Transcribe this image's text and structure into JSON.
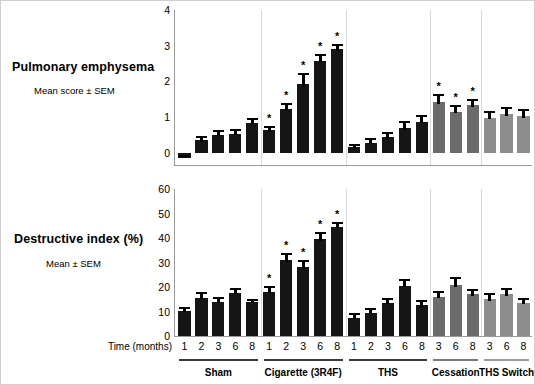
{
  "figure": {
    "xaxis_caption": "Time (months)",
    "groups": [
      {
        "name": "Sham",
        "times": [
          "1",
          "2",
          "3",
          "6",
          "8"
        ],
        "shade": "dark"
      },
      {
        "name": "Cigarette (3R4F)",
        "times": [
          "1",
          "2",
          "3",
          "6",
          "8"
        ],
        "shade": "dark"
      },
      {
        "name": "THS",
        "times": [
          "1",
          "2",
          "3",
          "6",
          "8"
        ],
        "shade": "dark"
      },
      {
        "name": "Cessation",
        "times": [
          "3",
          "6",
          "8"
        ],
        "shade": "mid"
      },
      {
        "name": "THS Switch",
        "times": [
          "3",
          "6",
          "8"
        ],
        "shade": "light"
      }
    ],
    "colors": {
      "dark": "#151515",
      "mid": "#6b6b6b",
      "light": "#8d8d8d",
      "separator": "#d9d9d9",
      "axis": "#9a9a9a"
    },
    "significance_marker": "*"
  },
  "chart_data": [
    {
      "type": "bar",
      "title": "Pulmonary emphysema",
      "subtitle": "Mean score ± SEM",
      "xlabel": "Time (months)",
      "ylabel": "Mean score ± SEM",
      "ylim": [
        -0.35,
        4.0
      ],
      "yticks": [
        0,
        1,
        2,
        3,
        4
      ],
      "ytick_labels": [
        "0",
        "1",
        "2",
        "3",
        "4"
      ],
      "grid": false,
      "legend_position": "none",
      "categories": [
        "Sham 1",
        "Sham 2",
        "Sham 3",
        "Sham 6",
        "Sham 8",
        "Cigarette 1",
        "Cigarette 2",
        "Cigarette 3",
        "Cigarette 6",
        "Cigarette 8",
        "THS 1",
        "THS 2",
        "THS 3",
        "THS 6",
        "THS 8",
        "Cessation 3",
        "Cessation 6",
        "Cessation 8",
        "THS Switch 3",
        "THS Switch 6",
        "THS Switch 8"
      ],
      "values": [
        -0.15,
        0.34,
        0.5,
        0.52,
        0.83,
        0.62,
        1.23,
        1.93,
        2.58,
        2.9,
        0.15,
        0.28,
        0.43,
        0.68,
        0.87,
        1.43,
        1.15,
        1.33,
        0.98,
        1.08,
        1.03
      ],
      "errors": [
        0.07,
        0.13,
        0.12,
        0.14,
        0.13,
        0.12,
        0.16,
        0.3,
        0.19,
        0.15,
        0.1,
        0.14,
        0.16,
        0.2,
        0.18,
        0.22,
        0.18,
        0.17,
        0.18,
        0.2,
        0.19
      ],
      "significant": [
        false,
        false,
        false,
        false,
        false,
        true,
        true,
        true,
        true,
        true,
        false,
        false,
        false,
        false,
        false,
        true,
        true,
        true,
        false,
        false,
        false
      ],
      "shades": [
        "dark",
        "dark",
        "dark",
        "dark",
        "dark",
        "dark",
        "dark",
        "dark",
        "dark",
        "dark",
        "dark",
        "dark",
        "dark",
        "dark",
        "dark",
        "mid",
        "mid",
        "mid",
        "light",
        "light",
        "light"
      ]
    },
    {
      "type": "bar",
      "title": "Destructive index (%)",
      "subtitle": "Mean ± SEM",
      "xlabel": "Time (months)",
      "ylabel": "Mean ± SEM",
      "ylim": [
        0,
        60
      ],
      "yticks": [
        0,
        10,
        20,
        30,
        40,
        50,
        60
      ],
      "ytick_labels": [
        "0",
        "10",
        "20",
        "30",
        "40",
        "50",
        "60"
      ],
      "grid": false,
      "legend_position": "none",
      "categories": [
        "Sham 1",
        "Sham 2",
        "Sham 3",
        "Sham 6",
        "Sham 8",
        "Cigarette 1",
        "Cigarette 2",
        "Cigarette 3",
        "Cigarette 6",
        "Cigarette 8",
        "THS 1",
        "THS 2",
        "THS 3",
        "THS 6",
        "THS 8",
        "Cessation 3",
        "Cessation 6",
        "Cessation 8",
        "THS Switch 3",
        "THS Switch 6",
        "THS Switch 8"
      ],
      "values": [
        10.3,
        15.5,
        14.0,
        17.5,
        13.8,
        18.0,
        31.0,
        28.0,
        39.5,
        44.5,
        7.5,
        9.5,
        13.5,
        20.5,
        12.5,
        16.0,
        21.0,
        17.0,
        15.0,
        17.0,
        13.5
      ],
      "errors": [
        1.6,
        2.3,
        1.8,
        1.9,
        1.5,
        2.6,
        2.7,
        3.2,
        2.9,
        2.2,
        1.7,
        2.0,
        1.9,
        2.7,
        2.0,
        2.4,
        3.2,
        2.0,
        2.4,
        2.6,
        2.1
      ],
      "significant": [
        false,
        false,
        false,
        false,
        false,
        true,
        true,
        true,
        true,
        true,
        false,
        false,
        false,
        false,
        false,
        false,
        false,
        false,
        false,
        false,
        false
      ],
      "shades": [
        "dark",
        "dark",
        "dark",
        "dark",
        "dark",
        "dark",
        "dark",
        "dark",
        "dark",
        "dark",
        "dark",
        "dark",
        "dark",
        "dark",
        "dark",
        "mid",
        "mid",
        "mid",
        "light",
        "light",
        "light"
      ]
    }
  ]
}
